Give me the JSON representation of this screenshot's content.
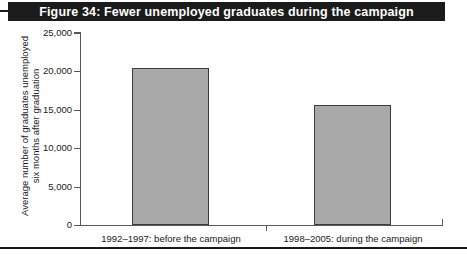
{
  "figure": {
    "title": "Figure 34: Fewer unemployed graduates during the campaign",
    "banner_color": "#1b1b1b",
    "banner_text_color": "#ffffff"
  },
  "chart_data": {
    "type": "bar",
    "title": "Figure 34: Fewer unemployed graduates during the campaign",
    "categories": [
      "1992–1997: before the campaign",
      "1998–2005: during the campaign"
    ],
    "values": [
      20400,
      15600
    ],
    "xlabel": "",
    "ylabel": "Average number of graduates unemployed six months after graduation",
    "ylabel_lines": [
      "Average number of graduates unemployed",
      "six months after graduation"
    ],
    "ylim": [
      0,
      25000
    ],
    "ytick_values": [
      25000,
      20000,
      15000,
      10000,
      5000,
      0
    ],
    "ytick_labels": [
      "25,000",
      "20,000",
      "15,000",
      "10,000",
      "5,000",
      "0"
    ],
    "grid": false,
    "legend": null,
    "bar_fill_color": "#a9a9a9",
    "bar_edge_color": "#3d3d3d",
    "axis_color": "#5a5a5a"
  }
}
